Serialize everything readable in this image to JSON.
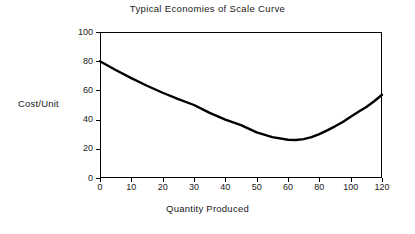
{
  "chart_data": {
    "type": "line",
    "title": "Typical Economies of Scale Curve",
    "xlabel": "Quantity Produced",
    "ylabel": "Cost/Unit",
    "xlim": [
      0,
      120
    ],
    "ylim": [
      0,
      100
    ],
    "grid": false,
    "legend": false,
    "legend_position": "none",
    "frame": "box",
    "xticklabels": [
      "0",
      "10",
      "20",
      "30",
      "40",
      "50",
      "60",
      "80",
      "100",
      "120"
    ],
    "yticklabels": [
      "0",
      "20",
      "40",
      "60",
      "80",
      "100"
    ],
    "ytick_values": [
      0,
      20,
      40,
      60,
      80,
      100
    ],
    "series": [
      {
        "name": "Average Cost per Unit",
        "color": "#000000",
        "linewidth": 2.4,
        "x": [
          0,
          5,
          10,
          15,
          20,
          25,
          30,
          35,
          40,
          45,
          50,
          55,
          60,
          65,
          70,
          75,
          80,
          85,
          90,
          95,
          100,
          105,
          110,
          115,
          120
        ],
        "y": [
          80.0,
          74.0,
          68.4,
          63.2,
          58.4,
          54.0,
          50.0,
          44.6,
          40.0,
          36.2,
          31.2,
          28.0,
          26.2,
          26.0,
          26.6,
          28.0,
          30.0,
          32.6,
          35.4,
          38.4,
          42.0,
          45.4,
          48.6,
          52.6,
          57.0
        ]
      }
    ],
    "annotations": [],
    "minimum": {
      "x": 60,
      "y": 26.0
    },
    "endpoints": {
      "start": {
        "x": 0,
        "y": 80
      },
      "end": {
        "x": 120,
        "y": 57
      }
    }
  },
  "colors": {
    "background": "#ffffff",
    "axis": "#000000",
    "text": "#1a1a1a",
    "curve": "#000000"
  }
}
